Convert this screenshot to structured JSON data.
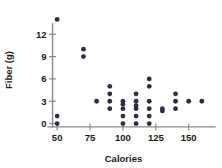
{
  "chart_data": {
    "type": "scatter",
    "title": "",
    "xlabel": "Calories",
    "ylabel": "Fiber (g)",
    "xlim": [
      40,
      170
    ],
    "ylim": [
      -0.6,
      15
    ],
    "grid": false,
    "legend": null,
    "xticks": [
      50,
      75,
      100,
      125,
      150
    ],
    "xticklabels": [
      "50",
      "75",
      "100",
      "125",
      "150"
    ],
    "yticks": [
      0,
      3,
      6,
      9,
      12
    ],
    "yticklabels": [
      "0",
      "3",
      "6",
      "9",
      "12"
    ],
    "marker": {
      "shape": "circle",
      "color": "#2c2c42",
      "size": 2.4
    },
    "points": [
      {
        "x": 50,
        "y": 14
      },
      {
        "x": 50,
        "y": 1
      },
      {
        "x": 50,
        "y": 0
      },
      {
        "x": 70,
        "y": 10
      },
      {
        "x": 70,
        "y": 9
      },
      {
        "x": 80,
        "y": 3
      },
      {
        "x": 90,
        "y": 5
      },
      {
        "x": 90,
        "y": 4
      },
      {
        "x": 90,
        "y": 3
      },
      {
        "x": 90,
        "y": 2
      },
      {
        "x": 100,
        "y": 3
      },
      {
        "x": 100,
        "y": 2.6
      },
      {
        "x": 100,
        "y": 2
      },
      {
        "x": 100,
        "y": 1
      },
      {
        "x": 100,
        "y": 0
      },
      {
        "x": 110,
        "y": 4
      },
      {
        "x": 110,
        "y": 3
      },
      {
        "x": 110,
        "y": 2.4
      },
      {
        "x": 110,
        "y": 2
      },
      {
        "x": 110,
        "y": 1
      },
      {
        "x": 110,
        "y": 0
      },
      {
        "x": 120,
        "y": 6
      },
      {
        "x": 120,
        "y": 5
      },
      {
        "x": 120,
        "y": 3
      },
      {
        "x": 120,
        "y": 2
      },
      {
        "x": 120,
        "y": 1
      },
      {
        "x": 120,
        "y": 0
      },
      {
        "x": 130,
        "y": 2
      },
      {
        "x": 130,
        "y": 1.7
      },
      {
        "x": 140,
        "y": 4
      },
      {
        "x": 140,
        "y": 3
      },
      {
        "x": 140,
        "y": 2
      },
      {
        "x": 150,
        "y": 3
      },
      {
        "x": 160,
        "y": 3
      }
    ]
  }
}
